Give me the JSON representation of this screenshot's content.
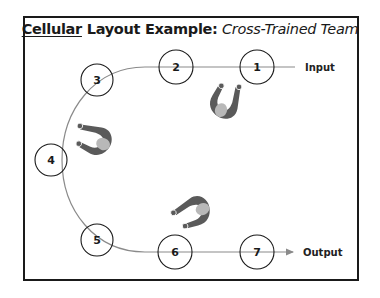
{
  "title": {
    "underlined": "Cellular",
    "bold_rest": " Layout Example:",
    "italic": " Cross-Trained Team"
  },
  "flow": {
    "input_label": "Input",
    "output_label": "Output"
  },
  "stations": [
    {
      "id": "1",
      "label": "1",
      "cx": 257,
      "cy": 67
    },
    {
      "id": "2",
      "label": "2",
      "cx": 176,
      "cy": 67
    },
    {
      "id": "3",
      "label": "3",
      "cx": 97,
      "cy": 80
    },
    {
      "id": "4",
      "label": "4",
      "cx": 51,
      "cy": 160
    },
    {
      "id": "5",
      "label": "5",
      "cx": 97,
      "cy": 240
    },
    {
      "id": "6",
      "label": "6",
      "cx": 175,
      "cy": 252
    },
    {
      "id": "7",
      "label": "7",
      "cx": 257,
      "cy": 252
    }
  ],
  "workers": [
    {
      "name": "worker-1",
      "position": "between stations 1-2, facing up"
    },
    {
      "name": "worker-2",
      "position": "between stations 3-4, facing left"
    },
    {
      "name": "worker-3",
      "position": "between stations 5-6, facing down-left"
    }
  ],
  "colors": {
    "frame": "#1a1a1a",
    "line": "#8a8a8a",
    "worker_body": "#5a5a5a",
    "worker_head": "#b8b8b8"
  }
}
